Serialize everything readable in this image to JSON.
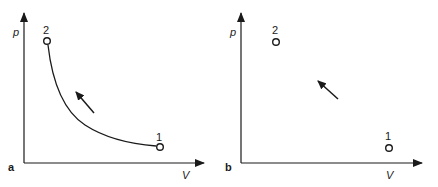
{
  "colors": {
    "ink": "#1a1a1a",
    "background": "#ffffff"
  },
  "panels": [
    {
      "label": "a",
      "y_axis_label": "p",
      "x_axis_label": "V",
      "points": [
        {
          "label": "2",
          "description": "high pressure, low volume"
        },
        {
          "label": "1",
          "description": "low pressure, high volume"
        }
      ],
      "path": "continuous curve from state 1 to state 2 (quasi-static compression)",
      "arrow_direction": "from 1 toward 2 (up-left)"
    },
    {
      "label": "b",
      "y_axis_label": "p",
      "x_axis_label": "V",
      "points": [
        {
          "label": "2",
          "description": "high pressure, low volume"
        },
        {
          "label": "1",
          "description": "low pressure, high volume"
        }
      ],
      "path": "no defined path between states (non-quasi-static process)",
      "arrow_direction": "from 1 toward 2 (up-left)"
    }
  ]
}
